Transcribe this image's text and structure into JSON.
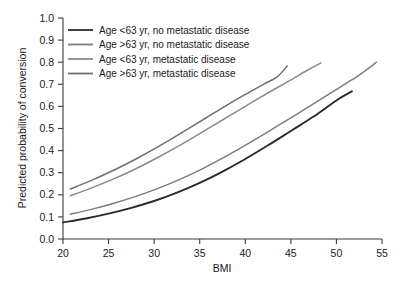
{
  "chart_data": {
    "type": "line",
    "title": "",
    "xlabel": "BMI",
    "ylabel": "Predicted probability of conversion",
    "xlim": [
      20,
      55
    ],
    "ylim": [
      0.0,
      1.0
    ],
    "xticks": [
      20,
      25,
      30,
      35,
      40,
      45,
      50,
      55
    ],
    "xtick_labels": [
      "20",
      "25",
      "30",
      "35",
      "40",
      "45",
      "50",
      "55"
    ],
    "yticks": [
      0.0,
      0.1,
      0.2,
      0.3,
      0.4,
      0.5,
      0.6,
      0.7,
      0.8,
      0.9,
      1.0
    ],
    "ytick_labels": [
      "0.0",
      "0.1",
      "0.2",
      "0.3",
      "0.4",
      "0.5",
      "0.6",
      "0.7",
      "0.8",
      "0.9",
      "1.0"
    ],
    "grid": false,
    "legend_position": "upper-left",
    "series": [
      {
        "name": "Age <63 yr, no metastatic disease",
        "color": "#2b2b2b",
        "x": [
          20.0,
          22.5,
          25.0,
          27.5,
          30.0,
          32.5,
          35.0,
          37.5,
          40.0,
          42.5,
          45.0,
          47.5,
          50.0,
          51.7
        ],
        "y": [
          0.075,
          0.093,
          0.115,
          0.141,
          0.172,
          0.21,
          0.254,
          0.305,
          0.362,
          0.424,
          0.489,
          0.554,
          0.627,
          0.668
        ]
      },
      {
        "name": "Age >63 yr, no metastatic disease",
        "color": "#7d7d7d",
        "x": [
          20.8,
          23.0,
          25.5,
          28.0,
          30.5,
          33.0,
          35.5,
          38.0,
          40.5,
          43.0,
          45.5,
          48.0,
          50.5,
          52.5,
          54.4
        ],
        "y": [
          0.112,
          0.133,
          0.161,
          0.193,
          0.23,
          0.273,
          0.322,
          0.377,
          0.436,
          0.498,
          0.561,
          0.625,
          0.69,
          0.742,
          0.8
        ]
      },
      {
        "name": "Age <63 yr, metastatic disease",
        "color": "#8a8a8a",
        "x": [
          20.8,
          23.0,
          25.5,
          28.0,
          30.5,
          33.0,
          35.5,
          38.0,
          40.5,
          43.0,
          45.0,
          47.0,
          48.3
        ],
        "y": [
          0.196,
          0.229,
          0.271,
          0.318,
          0.371,
          0.428,
          0.489,
          0.551,
          0.613,
          0.673,
          0.72,
          0.768,
          0.797
        ]
      },
      {
        "name": "Age >63 yr, metastatic disease",
        "color": "#6f6f6f",
        "x": [
          20.8,
          23.0,
          25.5,
          28.0,
          30.5,
          33.0,
          35.5,
          38.0,
          40.0,
          42.0,
          43.5,
          44.6
        ],
        "y": [
          0.226,
          0.263,
          0.31,
          0.362,
          0.419,
          0.48,
          0.543,
          0.606,
          0.654,
          0.7,
          0.734,
          0.783
        ]
      }
    ]
  },
  "legend": {
    "items": [
      {
        "label": "Age <63 yr, no metastatic disease",
        "color": "#2b2b2b"
      },
      {
        "label": "Age >63 yr, no metastatic disease",
        "color": "#7d7d7d"
      },
      {
        "label": "Age <63 yr, metastatic disease",
        "color": "#8a8a8a"
      },
      {
        "label": "Age >63 yr, metastatic disease",
        "color": "#6f6f6f"
      }
    ]
  },
  "axes": {
    "x_title": "BMI",
    "y_title": "Predicted probability of conversion"
  }
}
